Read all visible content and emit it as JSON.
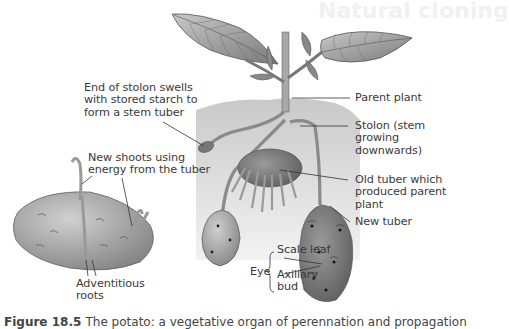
{
  "background_bleed": {
    "heading": "Natural cloning"
  },
  "figure": {
    "labels": {
      "stolon_end": "End of stolon swells\nwith stored starch to\nform a stem tuber",
      "new_shoots": "New shoots using\nenergy from the tuber",
      "adventitious_roots": "Adventitious\nroots",
      "parent_plant": "Parent plant",
      "stolon": "Stolon (stem\ngrowing\ndownwards)",
      "old_tuber": "Old tuber which\nproduced parent\nplant",
      "new_tuber": "New tuber",
      "eye": "Eye",
      "scale_leaf": "Scale leaf",
      "axillary_bud": "Axillary\nbud"
    },
    "caption": {
      "number": "Figure 18.5",
      "text": "The potato: a vegetative organ of perennation and propagation"
    }
  }
}
